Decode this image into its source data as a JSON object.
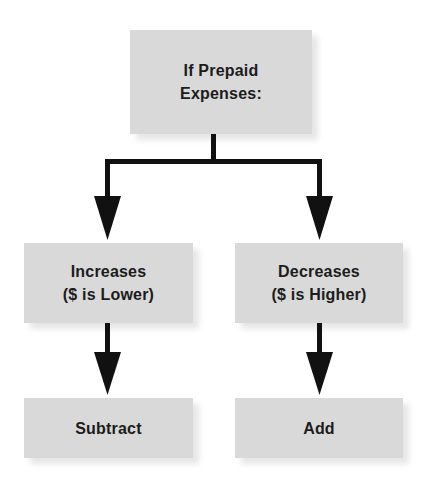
{
  "diagram": {
    "type": "flowchart",
    "root": {
      "label_lines": [
        "If Prepaid",
        "Expenses:"
      ]
    },
    "branches": [
      {
        "condition_lines": [
          "Increases",
          "($ is Lower)"
        ],
        "result": "Subtract"
      },
      {
        "condition_lines": [
          "Decreases",
          "($ is Higher)"
        ],
        "result": "Add"
      }
    ],
    "colors": {
      "box_fill": "#d9d9d9",
      "text": "#1c1c1c",
      "connector": "#111111",
      "background": "#ffffff"
    }
  }
}
